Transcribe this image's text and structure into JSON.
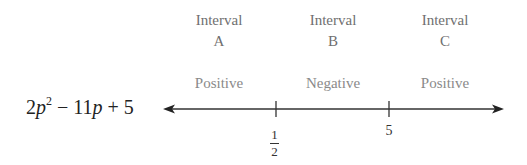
{
  "expression": {
    "coef": "2",
    "var": "p",
    "exp": "2",
    "rest_op1": " − 11",
    "var2": "p",
    "rest_op2": " + 5"
  },
  "intervals": [
    {
      "title": "Interval",
      "letter": "A",
      "sign": "Positive"
    },
    {
      "title": "Interval",
      "letter": "B",
      "sign": "Negative"
    },
    {
      "title": "Interval",
      "letter": "C",
      "sign": "Positive"
    }
  ],
  "ticks": [
    {
      "label_num": "1",
      "label_den": "2",
      "value": "1/2"
    },
    {
      "label": "5",
      "value": "5"
    }
  ],
  "colors": {
    "axis": "#333333",
    "interval_text": "#6f6f6f",
    "sign_text": "#8a8a8a"
  }
}
